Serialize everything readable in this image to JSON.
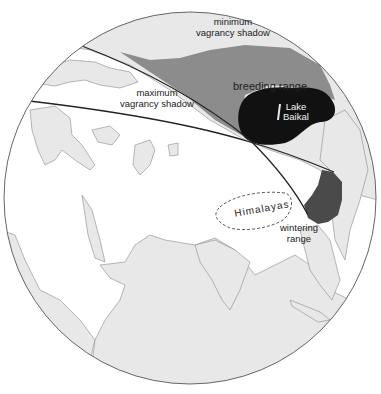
{
  "map": {
    "title": "Vagrancy shadow map of Asia",
    "projection": "orthographic globe",
    "colors": {
      "ocean": "#ffffff",
      "land": "#e8e8e8",
      "coastline": "#8a8a8a",
      "minimum_shadow": "#8c8c8c",
      "breeding_range": "#111111",
      "wintering_range": "#4a4a4a",
      "shadow_boundary": "#222222",
      "globe_outline": "#555555"
    },
    "labels": {
      "minimum_shadow_line1": "minimum",
      "minimum_shadow_line2": "vagrancy shadow",
      "maximum_shadow_line1": "maximum",
      "maximum_shadow_line2": "vagrancy shadow",
      "breeding_range": "breeding range",
      "lake_line1": "Lake",
      "lake_line2": "Baikal",
      "himalayas": "Himalayas",
      "wintering_line1": "wintering",
      "wintering_line2": "range"
    },
    "regions": [
      {
        "name": "minimum vagrancy shadow",
        "fill": "medium gray",
        "description": "band between upper great-circle line and breeding/wintering ranges"
      },
      {
        "name": "maximum vagrancy shadow",
        "fill": "white",
        "description": "wedge between the two great-circle lines"
      },
      {
        "name": "breeding range",
        "fill": "black",
        "around": "Lake Baikal"
      },
      {
        "name": "wintering range",
        "fill": "dark gray",
        "around": "southeast China"
      },
      {
        "name": "Himalayas",
        "fill": "none",
        "outline": "dashed"
      }
    ]
  }
}
